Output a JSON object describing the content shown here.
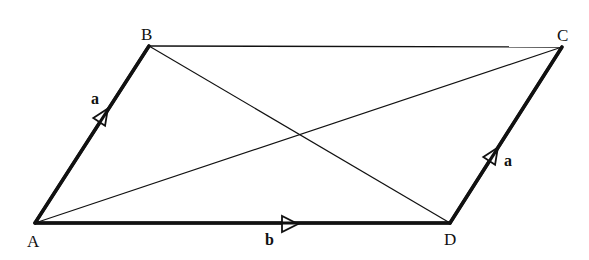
{
  "diagram": {
    "type": "parallelogram-vectors",
    "background": "#ffffff",
    "stroke_color": "#111111",
    "vertices": {
      "A": {
        "label": "A",
        "x": 35,
        "y": 223
      },
      "B": {
        "label": "B",
        "x": 149,
        "y": 46
      },
      "C": {
        "label": "C",
        "x": 562,
        "y": 47
      },
      "D": {
        "label": "D",
        "x": 450,
        "y": 223
      }
    },
    "edges": [
      {
        "from": "A",
        "to": "B",
        "style": "thick",
        "vector": "a"
      },
      {
        "from": "B",
        "to": "C",
        "style": "thin"
      },
      {
        "from": "D",
        "to": "C",
        "style": "thick",
        "vector": "a"
      },
      {
        "from": "A",
        "to": "D",
        "style": "thick",
        "vector": "b"
      },
      {
        "from": "A",
        "to": "C",
        "style": "thin",
        "role": "diagonal"
      },
      {
        "from": "B",
        "to": "D",
        "style": "thin",
        "role": "diagonal"
      }
    ],
    "vector_labels": {
      "ab": "a",
      "dc": "a",
      "ad": "b"
    }
  }
}
